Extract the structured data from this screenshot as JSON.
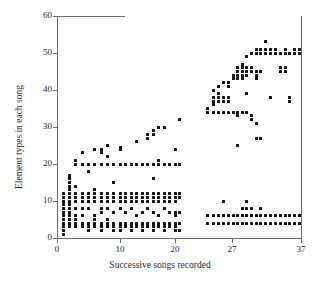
{
  "chart_data": {
    "type": "scatter",
    "title": "",
    "xlabel": "Successive songs recorded",
    "ylabel": "Element types in each song",
    "xlim": [
      0,
      37
    ],
    "ylim": [
      0,
      60
    ],
    "xticks": [
      0,
      10,
      20,
      27,
      37
    ],
    "xticklabels": [
      "0",
      "10",
      "20",
      "27",
      "37"
    ],
    "yticks": [
      0,
      10,
      20,
      30,
      40,
      50,
      60
    ],
    "yticklabels": [
      "0",
      "10",
      "20",
      "30",
      "40",
      "50",
      "60"
    ],
    "grid": false,
    "legend": null,
    "marker": "square",
    "marker_color": "#111111",
    "axis_color": "#6e6e6e",
    "points": [
      [
        1,
        1
      ],
      [
        1,
        2
      ],
      [
        1,
        3
      ],
      [
        1,
        4
      ],
      [
        1,
        5
      ],
      [
        1,
        6
      ],
      [
        1,
        7
      ],
      [
        1,
        8
      ],
      [
        1,
        9
      ],
      [
        1,
        10
      ],
      [
        1,
        11
      ],
      [
        1,
        12
      ],
      [
        2,
        3
      ],
      [
        2,
        4
      ],
      [
        2,
        5
      ],
      [
        2,
        6
      ],
      [
        2,
        7
      ],
      [
        2,
        8
      ],
      [
        2,
        9
      ],
      [
        2,
        10
      ],
      [
        2,
        11
      ],
      [
        2,
        12
      ],
      [
        2,
        13
      ],
      [
        2,
        14
      ],
      [
        2,
        15
      ],
      [
        2,
        16
      ],
      [
        2,
        17
      ],
      [
        3,
        3
      ],
      [
        3,
        4
      ],
      [
        3,
        5
      ],
      [
        3,
        6
      ],
      [
        3,
        8
      ],
      [
        3,
        10
      ],
      [
        3,
        11
      ],
      [
        3,
        12
      ],
      [
        3,
        14
      ],
      [
        3,
        20
      ],
      [
        3,
        21
      ],
      [
        4,
        3
      ],
      [
        4,
        4
      ],
      [
        4,
        6
      ],
      [
        4,
        8
      ],
      [
        4,
        10
      ],
      [
        4,
        11
      ],
      [
        4,
        12
      ],
      [
        4,
        20
      ],
      [
        4,
        23
      ],
      [
        5,
        2
      ],
      [
        5,
        3
      ],
      [
        5,
        4
      ],
      [
        5,
        8
      ],
      [
        5,
        10
      ],
      [
        5,
        11
      ],
      [
        5,
        12
      ],
      [
        5,
        18
      ],
      [
        5,
        20
      ],
      [
        6,
        3
      ],
      [
        6,
        4
      ],
      [
        6,
        5
      ],
      [
        6,
        6
      ],
      [
        6,
        10
      ],
      [
        6,
        11
      ],
      [
        6,
        12
      ],
      [
        6,
        13
      ],
      [
        6,
        20
      ],
      [
        6,
        24
      ],
      [
        7,
        2
      ],
      [
        7,
        3
      ],
      [
        7,
        4
      ],
      [
        7,
        7
      ],
      [
        7,
        8
      ],
      [
        7,
        10
      ],
      [
        7,
        11
      ],
      [
        7,
        12
      ],
      [
        7,
        20
      ],
      [
        7,
        23
      ],
      [
        7,
        24
      ],
      [
        8,
        3
      ],
      [
        8,
        4
      ],
      [
        8,
        5
      ],
      [
        8,
        8
      ],
      [
        8,
        10
      ],
      [
        8,
        11
      ],
      [
        8,
        12
      ],
      [
        8,
        20
      ],
      [
        8,
        22
      ],
      [
        8,
        25
      ],
      [
        9,
        2
      ],
      [
        9,
        3
      ],
      [
        9,
        4
      ],
      [
        9,
        7
      ],
      [
        9,
        10
      ],
      [
        9,
        11
      ],
      [
        9,
        12
      ],
      [
        9,
        15
      ],
      [
        9,
        20
      ],
      [
        10,
        2
      ],
      [
        10,
        3
      ],
      [
        10,
        4
      ],
      [
        10,
        8
      ],
      [
        10,
        10
      ],
      [
        10,
        11
      ],
      [
        10,
        12
      ],
      [
        10,
        20
      ],
      [
        10,
        24
      ],
      [
        10,
        24.5
      ],
      [
        11,
        3
      ],
      [
        11,
        4
      ],
      [
        11,
        7
      ],
      [
        11,
        10
      ],
      [
        11,
        11
      ],
      [
        11,
        12
      ],
      [
        11,
        20
      ],
      [
        12,
        2
      ],
      [
        12,
        3
      ],
      [
        12,
        4
      ],
      [
        12,
        8
      ],
      [
        12,
        10
      ],
      [
        12,
        11
      ],
      [
        12,
        12
      ],
      [
        12,
        20
      ],
      [
        13,
        3
      ],
      [
        13,
        4
      ],
      [
        13,
        6
      ],
      [
        13,
        10
      ],
      [
        13,
        11
      ],
      [
        13,
        12
      ],
      [
        13,
        20
      ],
      [
        13,
        26
      ],
      [
        14,
        2
      ],
      [
        14,
        3
      ],
      [
        14,
        4
      ],
      [
        14,
        7
      ],
      [
        14,
        10
      ],
      [
        14,
        11
      ],
      [
        14,
        12
      ],
      [
        14,
        20
      ],
      [
        15,
        3
      ],
      [
        15,
        4
      ],
      [
        15,
        8
      ],
      [
        15,
        10
      ],
      [
        15,
        11
      ],
      [
        15,
        12
      ],
      [
        15,
        20
      ],
      [
        15,
        27
      ],
      [
        15,
        28
      ],
      [
        16,
        2
      ],
      [
        16,
        3
      ],
      [
        16,
        4
      ],
      [
        16,
        7
      ],
      [
        16,
        10
      ],
      [
        16,
        11
      ],
      [
        16,
        12
      ],
      [
        16,
        16
      ],
      [
        16,
        20
      ],
      [
        16,
        28
      ],
      [
        16,
        29
      ],
      [
        17,
        3
      ],
      [
        17,
        4
      ],
      [
        17,
        6
      ],
      [
        17,
        10
      ],
      [
        17,
        11
      ],
      [
        17,
        12
      ],
      [
        17,
        20
      ],
      [
        17,
        21
      ],
      [
        17,
        30
      ],
      [
        18,
        2
      ],
      [
        18,
        3
      ],
      [
        18,
        4
      ],
      [
        18,
        8
      ],
      [
        18,
        10
      ],
      [
        18,
        11
      ],
      [
        18,
        12
      ],
      [
        18,
        20
      ],
      [
        18,
        30
      ],
      [
        19,
        3
      ],
      [
        19,
        4
      ],
      [
        19,
        7
      ],
      [
        19,
        10
      ],
      [
        19,
        11
      ],
      [
        19,
        12
      ],
      [
        19,
        20
      ],
      [
        20,
        2
      ],
      [
        20,
        3
      ],
      [
        20,
        4
      ],
      [
        20,
        6
      ],
      [
        20,
        7
      ],
      [
        20,
        10
      ],
      [
        20,
        11
      ],
      [
        20,
        12
      ],
      [
        20,
        20
      ],
      [
        20,
        24
      ],
      [
        20.6,
        2
      ],
      [
        20.6,
        4
      ],
      [
        20.6,
        7
      ],
      [
        20.6,
        11
      ],
      [
        20.6,
        12
      ],
      [
        20.6,
        20
      ],
      [
        20.6,
        32
      ],
      [
        24,
        4
      ],
      [
        24,
        6
      ],
      [
        24,
        34
      ],
      [
        24,
        35
      ],
      [
        24.7,
        4
      ],
      [
        24.7,
        6
      ],
      [
        24.7,
        34
      ],
      [
        24.7,
        36
      ],
      [
        24.7,
        37
      ],
      [
        24.7,
        38
      ],
      [
        24.7,
        40
      ],
      [
        25.4,
        4
      ],
      [
        25.4,
        6
      ],
      [
        25.4,
        34
      ],
      [
        25.4,
        37
      ],
      [
        25.4,
        38
      ],
      [
        25.4,
        39
      ],
      [
        25.4,
        41
      ],
      [
        26,
        4
      ],
      [
        26,
        6
      ],
      [
        26,
        10
      ],
      [
        26,
        34
      ],
      [
        26,
        37
      ],
      [
        26,
        38
      ],
      [
        26,
        42
      ],
      [
        26.6,
        4
      ],
      [
        26.6,
        6
      ],
      [
        26.6,
        34
      ],
      [
        26.6,
        37
      ],
      [
        26.6,
        38
      ],
      [
        26.6,
        41
      ],
      [
        26.6,
        42
      ],
      [
        27.2,
        4
      ],
      [
        27.2,
        6
      ],
      [
        27.2,
        34
      ],
      [
        27.2,
        43
      ],
      [
        27.2,
        44
      ],
      [
        27.8,
        4
      ],
      [
        27.8,
        6
      ],
      [
        27.8,
        25
      ],
      [
        27.8,
        33
      ],
      [
        27.8,
        34
      ],
      [
        27.8,
        43
      ],
      [
        27.8,
        44
      ],
      [
        27.8,
        45
      ],
      [
        27.8,
        46
      ],
      [
        28.5,
        4
      ],
      [
        28.5,
        6
      ],
      [
        28.5,
        8
      ],
      [
        28.5,
        34
      ],
      [
        28.5,
        43
      ],
      [
        28.5,
        44
      ],
      [
        28.5,
        45
      ],
      [
        28.5,
        46
      ],
      [
        28.5,
        47
      ],
      [
        29.1,
        4
      ],
      [
        29.1,
        6
      ],
      [
        29.1,
        8
      ],
      [
        29.1,
        10
      ],
      [
        29.1,
        34
      ],
      [
        29.1,
        39
      ],
      [
        29.1,
        44
      ],
      [
        29.1,
        45
      ],
      [
        29.1,
        46
      ],
      [
        29.1,
        49
      ],
      [
        29.8,
        4
      ],
      [
        29.8,
        6
      ],
      [
        29.8,
        8
      ],
      [
        29.8,
        32
      ],
      [
        29.8,
        33
      ],
      [
        29.8,
        45
      ],
      [
        29.8,
        46
      ],
      [
        29.8,
        50
      ],
      [
        30.5,
        4
      ],
      [
        30.5,
        6
      ],
      [
        30.5,
        27
      ],
      [
        30.5,
        31
      ],
      [
        30.5,
        43
      ],
      [
        30.5,
        44
      ],
      [
        30.5,
        45
      ],
      [
        30.5,
        50
      ],
      [
        30.5,
        51
      ],
      [
        31.2,
        4
      ],
      [
        31.2,
        6
      ],
      [
        31.2,
        8
      ],
      [
        31.2,
        27
      ],
      [
        31.2,
        45
      ],
      [
        31.2,
        50
      ],
      [
        31.2,
        51
      ],
      [
        31.9,
        4
      ],
      [
        31.9,
        6
      ],
      [
        31.9,
        50
      ],
      [
        31.9,
        51
      ],
      [
        31.9,
        53
      ],
      [
        32.6,
        4
      ],
      [
        32.6,
        6
      ],
      [
        32.6,
        38
      ],
      [
        32.6,
        50
      ],
      [
        32.6,
        51
      ],
      [
        33.3,
        4
      ],
      [
        33.3,
        6
      ],
      [
        33.3,
        50
      ],
      [
        33.3,
        51
      ],
      [
        34,
        4
      ],
      [
        34,
        6
      ],
      [
        34,
        45
      ],
      [
        34,
        46
      ],
      [
        34,
        50
      ],
      [
        34.7,
        4
      ],
      [
        34.7,
        6
      ],
      [
        34.7,
        45
      ],
      [
        34.7,
        46
      ],
      [
        34.7,
        50
      ],
      [
        34.7,
        51
      ],
      [
        35.4,
        4
      ],
      [
        35.4,
        6
      ],
      [
        35.4,
        37
      ],
      [
        35.4,
        38
      ],
      [
        35.4,
        50
      ],
      [
        36.1,
        4
      ],
      [
        36.1,
        6
      ],
      [
        36.1,
        50
      ],
      [
        36.1,
        51
      ],
      [
        36.8,
        4
      ],
      [
        36.8,
        6
      ],
      [
        36.8,
        50
      ],
      [
        36.8,
        51
      ]
    ]
  },
  "geometry": {
    "plot_left": 57,
    "plot_right": 301,
    "plot_top": 16,
    "plot_bottom": 238,
    "x_breaks": [
      [
        0,
        57
      ],
      [
        10,
        120
      ],
      [
        20,
        175
      ],
      [
        27,
        232
      ],
      [
        37,
        301
      ]
    ]
  }
}
